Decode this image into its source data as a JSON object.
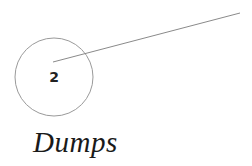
{
  "callout": {
    "number": "2",
    "label": "Dumps",
    "circle": {
      "cx": 54,
      "cy": 77,
      "r": 39,
      "stroke": "#9a9a9a"
    },
    "leader_line": {
      "x1": 53,
      "y1": 62,
      "x2": 240,
      "y2": 13,
      "stroke": "#8a8a8a"
    }
  }
}
